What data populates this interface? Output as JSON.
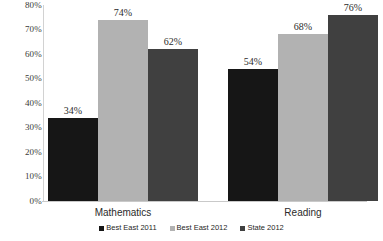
{
  "chart_data": {
    "type": "bar",
    "title": "",
    "subtitle": "",
    "xlabel": "",
    "ylabel": "",
    "categories": [
      "Mathematics",
      "Reading"
    ],
    "series": [
      {
        "name": "Best East 2011",
        "color": "#161616",
        "values": [
          34,
          54
        ],
        "labels": [
          "34%",
          "54%"
        ]
      },
      {
        "name": "Best East 2012",
        "color": "#b2b2b2",
        "values": [
          74,
          68
        ],
        "labels": [
          "74%",
          "68%"
        ]
      },
      {
        "name": "State 2012",
        "color": "#404040",
        "values": [
          62,
          76
        ],
        "labels": [
          "62%",
          "76%"
        ]
      }
    ],
    "ylim": [
      0,
      80
    ],
    "ytick_labels": [
      "80%",
      "70%",
      "60%",
      "50%",
      "40%",
      "30%",
      "20%",
      "10%",
      "0%"
    ],
    "ytick_values": [
      80,
      70,
      60,
      50,
      40,
      30,
      20,
      10,
      0
    ],
    "grid": false,
    "legend_position": "bottom",
    "value_labels_shown": true,
    "axis_color": "#c9c9c9"
  }
}
